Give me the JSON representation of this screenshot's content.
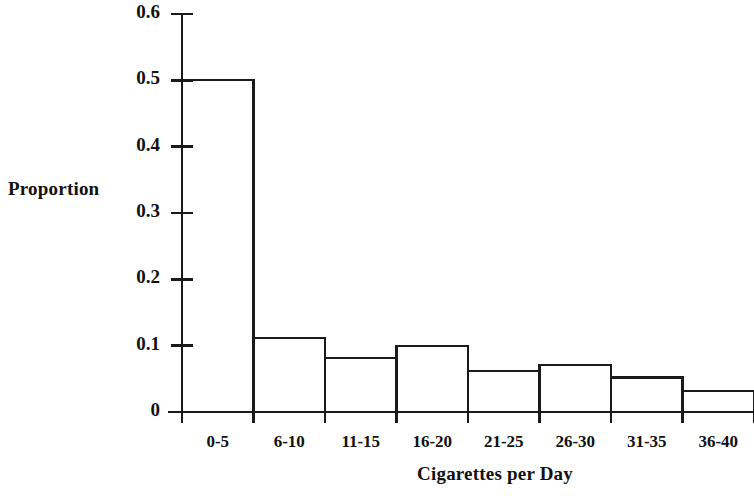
{
  "chart_data": {
    "type": "bar",
    "title": "",
    "subtitle": "",
    "xlabel": "Cigarettes per Day",
    "ylabel": "Proportion",
    "categories": [
      "0-5",
      "6-10",
      "11-15",
      "16-20",
      "21-25",
      "26-30",
      "31-35",
      "36-40"
    ],
    "values": [
      0.5,
      0.112,
      0.082,
      0.1,
      0.062,
      0.071,
      0.052,
      0.032
    ],
    "ylim": [
      0,
      0.6
    ],
    "ytick_labels": [
      "0",
      "0.1",
      "0.2",
      "0.3",
      "0.4",
      "0.5",
      "0.6"
    ],
    "ytick_values": [
      0,
      0.1,
      0.2,
      0.3,
      0.4,
      0.5,
      0.6
    ],
    "grid": false,
    "legend": null,
    "legend_position": "none",
    "bar_fill": "#ffffff",
    "bar_edge": "#1a1a1a",
    "axis_color": "#1a1a1a",
    "annotations": []
  },
  "style": {
    "background": "#ffffff",
    "text_color": "#111111"
  }
}
